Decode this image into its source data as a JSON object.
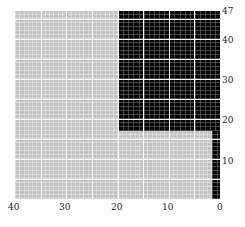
{
  "chart_data": {
    "type": "heatmap",
    "title": "",
    "xlabel": "",
    "ylabel": "",
    "x_axis": {
      "range": [
        40,
        0
      ],
      "reversed": true,
      "ticks": [
        "40",
        "30",
        "20",
        "10",
        "0"
      ],
      "position": "bottom"
    },
    "y_axis": {
      "range": [
        0,
        47
      ],
      "ticks": [
        "10",
        "20",
        "30",
        "40",
        "47"
      ],
      "position": "right"
    },
    "grid": {
      "major_every": 5,
      "minor_every": 1,
      "major_color": "#ffffff"
    },
    "regions": [
      {
        "label": "gray",
        "color": "#c4c4c4",
        "x": [
          40,
          0
        ],
        "y": [
          0,
          47
        ]
      },
      {
        "label": "black-upper",
        "color": "#050505",
        "x": [
          20,
          0
        ],
        "y": [
          17,
          47
        ]
      },
      {
        "label": "black-strip",
        "color": "#050505",
        "x": [
          1.5,
          0
        ],
        "y": [
          0,
          17
        ]
      }
    ],
    "legend": null
  },
  "axis_labels": {
    "x": [
      "40",
      "30",
      "20",
      "10",
      "0"
    ],
    "y": [
      "47",
      "40",
      "30",
      "20",
      "10"
    ]
  }
}
